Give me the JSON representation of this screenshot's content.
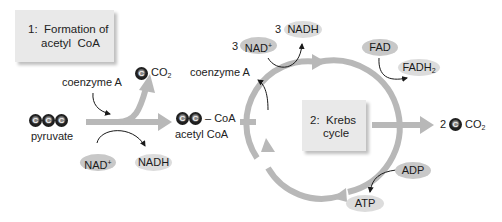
{
  "stage1": {
    "box_label_line1": "1:  Formation of",
    "box_label_line2": "acetyl  CoA"
  },
  "stage2": {
    "box_label_line1": "2:  Krebs",
    "box_label_line2": "cycle"
  },
  "molecules": {
    "pyruvate": {
      "label": "pyruvate",
      "carbons": [
        "C",
        "C",
        "C"
      ]
    },
    "acetyl_coa": {
      "label": "acetyl CoA",
      "carbons": [
        "C",
        "C"
      ],
      "suffix": "– CoA"
    },
    "co2_stage1": {
      "carbon": "C",
      "label": "CO",
      "sub": "2"
    },
    "co2_stage2": {
      "count": "2",
      "carbon": "C",
      "label": "CO",
      "sub": "2"
    }
  },
  "cofactors": {
    "coenzyme_a_in": "coenzyme A",
    "coenzyme_a_out": "coenzyme A",
    "nad_stage1": {
      "label": "NAD",
      "sup": "+"
    },
    "nadh_stage1": {
      "label": "NADH"
    },
    "nad_stage2": {
      "count": "3",
      "label": "NAD",
      "sup": "+"
    },
    "nadh_stage2": {
      "count": "3",
      "label": "NADH"
    },
    "fad": {
      "label": "FAD"
    },
    "fadh2": {
      "label": "FADH",
      "sub": "2"
    },
    "adp": {
      "label": "ADP"
    },
    "atp": {
      "label": "ATP"
    }
  },
  "colors": {
    "flow_arrow": "#b8b8b8",
    "box_fill": "#e9e9e9",
    "pill_dark": "#c8c8c8",
    "pill_light": "#dcdcdc",
    "carbon": "#111111",
    "thin_arrow": "#1a1a1a"
  }
}
